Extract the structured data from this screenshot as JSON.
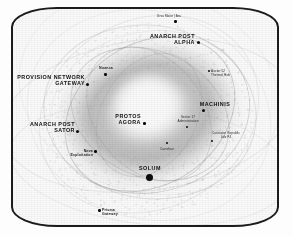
{
  "view": {
    "kind": "star-map-display",
    "frame_style": "rounded-crt-bezel",
    "palette": {
      "background": "#ffffff",
      "bezel": "#1c1c1c",
      "ink": "#101010",
      "core_glow": "#ffffff",
      "dust": "#8a8a8a"
    }
  },
  "map": {
    "subject": "spiral galaxy",
    "points_of_interest": [
      {
        "id": "ursa-maior-ara",
        "label": "Ursa Maior | Ara",
        "tier": "tiny",
        "marker": "small",
        "align": "center"
      },
      {
        "id": "anarch-post-alpha",
        "label": "ANARCH POST\nALPHA",
        "tier": "major",
        "marker": "medium",
        "align": "right"
      },
      {
        "id": "nuanca",
        "label": "Nuanca",
        "tier": "minor",
        "marker": "small",
        "align": "center"
      },
      {
        "id": "auctor-52-thermal-hub",
        "label": "Auctor 52\nThermal Hub",
        "tier": "tiny",
        "marker": "small",
        "align": "left"
      },
      {
        "id": "provision-network-gateway",
        "label": "PROVISION NETWORK\nGATEWAY",
        "tier": "major",
        "marker": "medium",
        "align": "right"
      },
      {
        "id": "machinis",
        "label": "MACHINIS",
        "tier": "major",
        "marker": "medium",
        "align": "center"
      },
      {
        "id": "protos-agora",
        "label": "PROTOS\nAGORA",
        "tier": "major",
        "marker": "small",
        "align": "right"
      },
      {
        "id": "sector-17-administration",
        "label": "Sector 17\nAdministration",
        "tier": "tiny",
        "marker": "small",
        "align": "center"
      },
      {
        "id": "anarch-post-sator",
        "label": "ANARCH POST\nSATOR",
        "tier": "major",
        "marker": "medium",
        "align": "right"
      },
      {
        "id": "cunctator-republic-lab-p4",
        "label": "Cunctator Republic\nLab P4",
        "tier": "tiny",
        "marker": "small",
        "align": "center"
      },
      {
        "id": "carrefour",
        "label": "Carrefour",
        "tier": "tiny",
        "marker": "small",
        "align": "center"
      },
      {
        "id": "nova-exploitation",
        "label": "Nova\nExploitation",
        "tier": "minor",
        "marker": "small",
        "align": "right"
      },
      {
        "id": "solum",
        "label": "SOLUM",
        "tier": "major",
        "marker": "large",
        "align": "center"
      },
      {
        "id": "prisma-gateway",
        "label": "Prisma\nGateway",
        "tier": "minor",
        "marker": "small",
        "align": "left"
      }
    ]
  }
}
